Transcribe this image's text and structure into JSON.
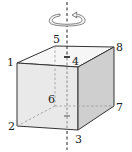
{
  "diagram": {
    "type": "cube-rotation",
    "rotation_icon": "circular-arrow-icon",
    "vertices": [
      {
        "label": "1",
        "x": 17,
        "y": 63
      },
      {
        "label": "2",
        "x": 17,
        "y": 126
      },
      {
        "label": "3",
        "x": 78,
        "y": 130
      },
      {
        "label": "4",
        "x": 78,
        "y": 67
      },
      {
        "label": "5",
        "x": 55,
        "y": 46
      },
      {
        "label": "6",
        "x": 55,
        "y": 106
      },
      {
        "label": "7",
        "x": 114,
        "y": 106
      },
      {
        "label": "8",
        "x": 114,
        "y": 47
      }
    ],
    "labels": {
      "v1": "1",
      "v2": "2",
      "v3": "3",
      "v4": "4",
      "v5": "5",
      "v6": "6",
      "v7": "7",
      "v8": "8"
    },
    "colors": {
      "front_face": "#eaeaea",
      "right_face": "#cdcdcd",
      "top_face": "#f6f6f6",
      "edge": "#333333",
      "hidden_edge": "#999999"
    }
  }
}
